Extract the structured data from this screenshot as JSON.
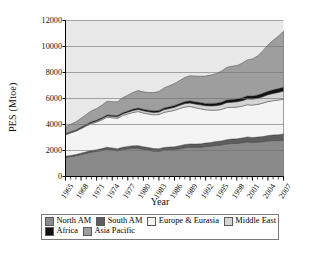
{
  "chart_data": {
    "type": "area",
    "stacked": true,
    "title": "",
    "xlabel": "Year",
    "ylabel": "PES (Mtoe)",
    "ylim": [
      0,
      12000
    ],
    "ytick_step": 2000,
    "yticks": [
      0,
      2000,
      4000,
      6000,
      8000,
      10000,
      12000
    ],
    "ytick_labels": [
      "0",
      "2000",
      "4000",
      "6000",
      "8000",
      "10000",
      "12000"
    ],
    "xlim": [
      1965,
      2007
    ],
    "xtick_step": 3,
    "xticks": [
      1965,
      1968,
      1971,
      1974,
      1977,
      1980,
      1983,
      1986,
      1989,
      1992,
      1995,
      1998,
      2001,
      2004,
      2007
    ],
    "xtick_labels": [
      "1965",
      "1968",
      "1971",
      "1974",
      "1977",
      "1980",
      "1983",
      "1986",
      "1989",
      "1992",
      "1995",
      "1998",
      "2001",
      "2004",
      "2007"
    ],
    "grid": "horizontal",
    "legend_position": "bottom",
    "x": [
      1965,
      1966,
      1967,
      1968,
      1969,
      1970,
      1971,
      1972,
      1973,
      1974,
      1975,
      1976,
      1977,
      1978,
      1979,
      1980,
      1981,
      1982,
      1983,
      1984,
      1985,
      1986,
      1987,
      1988,
      1989,
      1990,
      1991,
      1992,
      1993,
      1994,
      1995,
      1996,
      1997,
      1998,
      1999,
      2000,
      2001,
      2002,
      2003,
      2004,
      2005,
      2006,
      2007
    ],
    "series": [
      {
        "name": "North AM",
        "color": "#8a8a8a",
        "values": [
          1460,
          1530,
          1590,
          1690,
          1790,
          1880,
          1930,
          2010,
          2110,
          2050,
          1980,
          2080,
          2140,
          2180,
          2180,
          2090,
          2030,
          1950,
          1940,
          2030,
          2050,
          2070,
          2140,
          2220,
          2260,
          2250,
          2250,
          2300,
          2340,
          2390,
          2420,
          2500,
          2540,
          2550,
          2600,
          2670,
          2620,
          2650,
          2680,
          2740,
          2760,
          2760,
          2800
        ]
      },
      {
        "name": "South AM",
        "color": "#5e5e5e",
        "values": [
          90,
          95,
          100,
          105,
          110,
          120,
          125,
          135,
          145,
          150,
          155,
          165,
          175,
          185,
          195,
          195,
          195,
          195,
          195,
          205,
          210,
          220,
          230,
          240,
          245,
          250,
          260,
          270,
          280,
          295,
          310,
          325,
          340,
          350,
          355,
          370,
          375,
          380,
          390,
          410,
          430,
          450,
          470
        ]
      },
      {
        "name": "Europe & Eurasia",
        "color": "#f4f4f4",
        "values": [
          1660,
          1730,
          1790,
          1880,
          1980,
          2070,
          2130,
          2210,
          2300,
          2320,
          2340,
          2440,
          2490,
          2560,
          2620,
          2600,
          2580,
          2600,
          2630,
          2700,
          2750,
          2800,
          2860,
          2890,
          2880,
          2790,
          2700,
          2560,
          2480,
          2420,
          2420,
          2470,
          2440,
          2440,
          2450,
          2480,
          2500,
          2510,
          2570,
          2610,
          2640,
          2670,
          2680
        ]
      },
      {
        "name": "Middle East",
        "color": "#d4d4d4",
        "values": [
          40,
          45,
          50,
          58,
          66,
          74,
          82,
          92,
          102,
          110,
          120,
          132,
          142,
          155,
          165,
          170,
          175,
          185,
          195,
          210,
          220,
          235,
          245,
          260,
          270,
          285,
          300,
          315,
          330,
          345,
          360,
          380,
          395,
          410,
          425,
          445,
          460,
          480,
          500,
          530,
          560,
          590,
          620
        ]
      },
      {
        "name": "Africa",
        "color": "#111111",
        "values": [
          45,
          48,
          52,
          56,
          61,
          66,
          70,
          76,
          82,
          85,
          88,
          94,
          100,
          106,
          112,
          115,
          118,
          122,
          126,
          132,
          138,
          144,
          150,
          157,
          163,
          168,
          174,
          180,
          186,
          192,
          198,
          206,
          214,
          220,
          226,
          234,
          240,
          248,
          258,
          270,
          282,
          292,
          305
        ]
      },
      {
        "name": "Asia Pacific",
        "color": "#9e9e9e",
        "values": [
          520,
          570,
          620,
          690,
          760,
          840,
          890,
          960,
          1050,
          1040,
          1060,
          1150,
          1210,
          1280,
          1340,
          1340,
          1360,
          1400,
          1460,
          1540,
          1610,
          1680,
          1760,
          1850,
          1930,
          1980,
          2030,
          2100,
          2190,
          2280,
          2380,
          2500,
          2560,
          2560,
          2660,
          2770,
          2850,
          3000,
          3260,
          3560,
          3800,
          4030,
          4300
        ]
      }
    ],
    "totals_endpoints": {
      "first_year": 1965,
      "first_total": 3815,
      "last_year": 2007,
      "last_total": 11175
    }
  },
  "legend": {
    "rows": [
      [
        {
          "label": "North AM",
          "color": "#8a8a8a"
        },
        {
          "label": "South AM",
          "color": "#5e5e5e"
        },
        {
          "label": "Europe & Eurasia",
          "color": "#f7f7f7"
        },
        {
          "label": "Middle East",
          "color": "#d4d4d4"
        }
      ],
      [
        {
          "label": "Africa",
          "color": "#111111"
        },
        {
          "label": "Asia Pacific",
          "color": "#9e9e9e"
        }
      ]
    ]
  },
  "axes": {
    "x_title": "Year",
    "y_title": "PES (Mtoe)"
  }
}
